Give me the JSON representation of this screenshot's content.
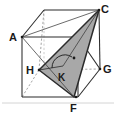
{
  "figure": {
    "kind": "geometry-diagram",
    "background_color": "#ffffff",
    "edge_color": "#2b2b2b",
    "hidden_edge_color": "#9a9a9a",
    "shade_fill_color": "#a8a8a8",
    "shade_stroke_color": "#2b2b2b",
    "accent_color": "#1a1a1a"
  },
  "labels": {
    "A": "A",
    "C": "C",
    "G": "G",
    "H": "H",
    "F": "F",
    "K": "K"
  },
  "vertices": {
    "A": {
      "x": 22,
      "y": 37
    },
    "C": {
      "x": 99,
      "y": 10
    },
    "G": {
      "x": 100,
      "y": 69
    },
    "H": {
      "x": 39,
      "y": 70
    },
    "F": {
      "x": 74,
      "y": 97
    },
    "K": {
      "x": 63,
      "y": 66
    }
  },
  "label_positions": {
    "A": {
      "x": 9,
      "y": 41
    },
    "C": {
      "x": 101,
      "y": 11
    },
    "G": {
      "x": 103,
      "y": 73
    },
    "H": {
      "x": 27,
      "y": 74
    },
    "F": {
      "x": 70,
      "y": 112
    },
    "K": {
      "x": 59,
      "y": 80
    }
  },
  "cube": {
    "front_face": [
      {
        "x": 22,
        "y": 37
      },
      {
        "x": 78,
        "y": 37
      },
      {
        "x": 78,
        "y": 97
      },
      {
        "x": 22,
        "y": 97
      }
    ],
    "back_face": [
      {
        "x": 44,
        "y": 10
      },
      {
        "x": 99,
        "y": 10
      },
      {
        "x": 100,
        "y": 69
      },
      {
        "x": 44,
        "y": 69
      }
    ],
    "visible_edges": [
      {
        "from": "A",
        "to": "top-back-left",
        "x1": 22,
        "y1": 37,
        "x2": 44,
        "y2": 10
      },
      {
        "from": "top-back-left",
        "to": "C",
        "x1": 44,
        "y1": 10,
        "x2": 99,
        "y2": 10
      },
      {
        "from": "front-top-right",
        "to": "C",
        "x1": 78,
        "y1": 37,
        "x2": 99,
        "y2": 10
      },
      {
        "from": "A",
        "to": "front-top-right",
        "x1": 22,
        "y1": 37,
        "x2": 78,
        "y2": 37
      },
      {
        "from": "A",
        "to": "front-bottom-left",
        "x1": 22,
        "y1": 37,
        "x2": 22,
        "y2": 97
      },
      {
        "from": "front-top-right",
        "to": "F",
        "x1": 78,
        "y1": 37,
        "x2": 78,
        "y2": 97
      },
      {
        "from": "front-bottom-left",
        "to": "F",
        "x1": 22,
        "y1": 97,
        "x2": 78,
        "y2": 97
      },
      {
        "from": "C",
        "to": "G",
        "x1": 99,
        "y1": 10,
        "x2": 100,
        "y2": 69
      },
      {
        "from": "F",
        "to": "G",
        "x1": 78,
        "y1": 97,
        "x2": 100,
        "y2": 69
      },
      {
        "from": "front-top-right",
        "to": "G-side",
        "x1": 78,
        "y1": 37,
        "x2": 100,
        "y2": 69
      }
    ],
    "hidden_edges": [
      {
        "from": "H",
        "to": "back-top-left",
        "x1": 39,
        "y1": 70,
        "x2": 44,
        "y2": 10
      },
      {
        "from": "H",
        "to": "G",
        "x1": 39,
        "y1": 70,
        "x2": 100,
        "y2": 69
      },
      {
        "from": "H",
        "to": "front-bottom-left",
        "x1": 39,
        "y1": 70,
        "x2": 22,
        "y2": 97
      }
    ]
  },
  "shaded_triangle": {
    "name": "triangle-HCF",
    "points": [
      {
        "label": "H",
        "x": 39,
        "y": 70
      },
      {
        "label": "C",
        "x": 99,
        "y": 10
      },
      {
        "label": "F",
        "x": 74,
        "y": 97
      }
    ],
    "fill": "#a8a8a8",
    "opacity": 1
  },
  "construction_lines": [
    {
      "name": "line-A-to-F",
      "x1": 22,
      "y1": 37,
      "x2": 74,
      "y2": 97
    },
    {
      "name": "line-A-to-C",
      "x1": 22,
      "y1": 37,
      "x2": 99,
      "y2": 10
    },
    {
      "name": "line-K-to-C",
      "x1": 63,
      "y1": 66,
      "x2": 99,
      "y2": 10
    }
  ],
  "angle_marker": {
    "name": "right-angle-at-K",
    "vertex": {
      "x": 63,
      "y": 66
    },
    "arc_radius": 13,
    "dot": {
      "x": 74,
      "y": 58,
      "r": 1.4
    },
    "arc_path": "M 52 68 A 13 13 0 0 1 72 57"
  },
  "border": {
    "bottom_line": {
      "x1": 2,
      "y1": 103,
      "x2": 114,
      "y2": 103
    },
    "color": "#c9c9c9"
  }
}
